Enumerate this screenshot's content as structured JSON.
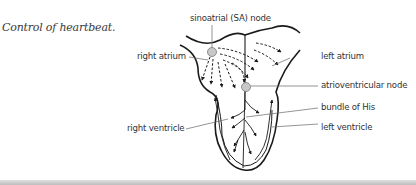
{
  "caption": "Control of heartbeat.",
  "diagram": {
    "labels": {
      "sa_node": "sinoatrial (SA) node",
      "right_atrium": "right atrium",
      "left_atrium": "left atrium",
      "av_node": "atrioventricular node",
      "bundle_of_his": "bundle of His",
      "right_ventricle": "right ventricle",
      "left_ventricle": "left ventricle"
    },
    "colors": {
      "outline": "#1a1a1a",
      "leader": "#666666",
      "node_fill": "#c8c8c8",
      "text": "#333333"
    }
  }
}
